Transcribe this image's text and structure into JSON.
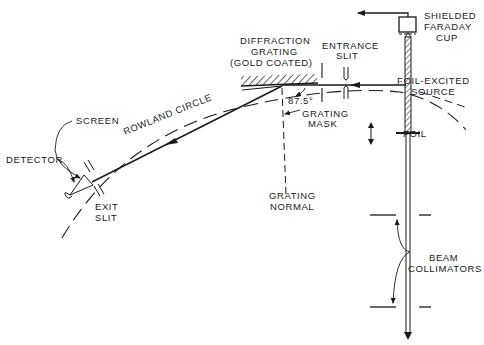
{
  "diagram": {
    "colors": {
      "ink": "#1a1a1a",
      "background": "#ffffff"
    },
    "labels": {
      "faraday_cup": [
        "SHIELDED",
        "FARADAY",
        "CUP"
      ],
      "diffraction_grating": [
        "DIFFRACTION",
        "GRATING",
        "(GOLD COATED)"
      ],
      "entrance_slit": [
        "ENTRANCE",
        "SLIT"
      ],
      "foil_excited_source": [
        "FOIL-EXCITED",
        "SOURCE"
      ],
      "angle": "87.5°",
      "grating_mask": [
        "GRATING",
        "MASK"
      ],
      "rowland_circle": "ROWLAND CIRCLE",
      "screen": "SCREEN",
      "detector": "DETECTOR",
      "exit_slit": [
        "EXIT",
        "SLIT"
      ],
      "foil": "FOIL",
      "grating_normal": [
        "GRATING",
        "NORMAL"
      ],
      "beam_collimators": [
        "BEAM",
        "COLLIMATORS"
      ]
    }
  }
}
